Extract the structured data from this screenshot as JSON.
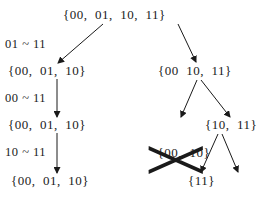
{
  "diagram": {
    "type": "search-tree",
    "nodes": {
      "root": "{00,  01,  10,  11}",
      "left1": "{00,  01,  10}",
      "left2": "{00,  01,  10}",
      "left3": "{00,  01,  10}",
      "right1": "{00  10,  11}",
      "right2a": "{00,  10}",
      "right2b": "{10,  11}",
      "right3a": "{11}",
      "right3b": "{10}"
    },
    "pruned_nodes": [
      "right2a",
      "right3b"
    ],
    "edge_labels": {
      "l1": "01 ~ 11",
      "l2": "00 ~ 11",
      "l3": "10 ~ 11"
    },
    "edges": [
      {
        "from": "root",
        "to": "left1"
      },
      {
        "from": "root",
        "to": "right1"
      },
      {
        "from": "left1",
        "to": "left2"
      },
      {
        "from": "left2",
        "to": "left3"
      },
      {
        "from": "right1",
        "to": "right2a"
      },
      {
        "from": "right1",
        "to": "right2b"
      },
      {
        "from": "right2b",
        "to": "right3a"
      },
      {
        "from": "right2b",
        "to": "right3b"
      }
    ],
    "colors": {
      "ink": "#1a1a1a",
      "background": "#ffffff"
    }
  }
}
